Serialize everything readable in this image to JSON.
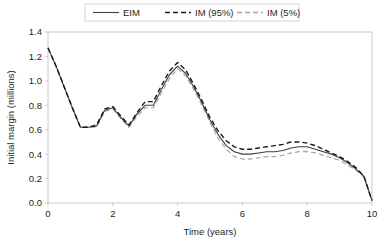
{
  "chart_data": {
    "type": "line",
    "title": "",
    "xlabel": "Time (years)",
    "ylabel": "Initial margin (millions)",
    "xlim": [
      0,
      10
    ],
    "ylim": [
      0,
      1.4
    ],
    "xticks": [
      0,
      2,
      4,
      6,
      8,
      10
    ],
    "xtick_labels": [
      "0",
      "2",
      "4",
      "6",
      "8",
      "10"
    ],
    "yticks": [
      0.0,
      0.2,
      0.4,
      0.6,
      0.8,
      1.0,
      1.2,
      1.4
    ],
    "ytick_labels": [
      "0.0",
      "0.2",
      "0.4",
      "0.6",
      "0.8",
      "1.0",
      "1.2",
      "1.4"
    ],
    "grid": false,
    "legend_position": "top-center",
    "x": [
      0,
      0.25,
      0.5,
      0.75,
      1.0,
      1.25,
      1.5,
      1.75,
      2.0,
      2.25,
      2.5,
      2.75,
      3.0,
      3.25,
      3.5,
      3.75,
      4.0,
      4.25,
      4.5,
      4.75,
      5.0,
      5.25,
      5.5,
      5.75,
      6.0,
      6.25,
      6.5,
      6.75,
      7.0,
      7.25,
      7.5,
      7.75,
      8.0,
      8.25,
      8.5,
      8.75,
      9.0,
      9.25,
      9.5,
      9.75,
      10.0
    ],
    "series": [
      {
        "name": "EIM",
        "style": "solid",
        "color": "#3f3f3f",
        "width": 1.1,
        "values": [
          1.27,
          1.12,
          0.95,
          0.78,
          0.62,
          0.62,
          0.63,
          0.76,
          0.78,
          0.7,
          0.63,
          0.73,
          0.8,
          0.8,
          0.93,
          1.05,
          1.12,
          1.06,
          0.95,
          0.82,
          0.68,
          0.56,
          0.47,
          0.42,
          0.4,
          0.4,
          0.41,
          0.42,
          0.42,
          0.43,
          0.45,
          0.46,
          0.46,
          0.44,
          0.42,
          0.4,
          0.37,
          0.33,
          0.28,
          0.22,
          0.02
        ]
      },
      {
        "name": "IM (95%)",
        "style": "dashed",
        "color": "#1a1a1a",
        "width": 1.4,
        "values": [
          1.27,
          1.12,
          0.95,
          0.78,
          0.62,
          0.62,
          0.64,
          0.77,
          0.79,
          0.71,
          0.64,
          0.74,
          0.83,
          0.83,
          0.96,
          1.08,
          1.15,
          1.09,
          0.97,
          0.84,
          0.7,
          0.59,
          0.51,
          0.46,
          0.44,
          0.44,
          0.45,
          0.46,
          0.47,
          0.48,
          0.5,
          0.5,
          0.49,
          0.47,
          0.44,
          0.41,
          0.38,
          0.34,
          0.29,
          0.22,
          0.02
        ]
      },
      {
        "name": "IM (5%)",
        "style": "dashed",
        "color": "#a6a6a6",
        "width": 1.2,
        "values": [
          1.27,
          1.12,
          0.95,
          0.78,
          0.62,
          0.62,
          0.62,
          0.75,
          0.77,
          0.69,
          0.62,
          0.71,
          0.78,
          0.78,
          0.9,
          1.02,
          1.1,
          1.04,
          0.93,
          0.8,
          0.66,
          0.53,
          0.44,
          0.38,
          0.36,
          0.36,
          0.37,
          0.38,
          0.38,
          0.39,
          0.41,
          0.42,
          0.42,
          0.41,
          0.39,
          0.37,
          0.35,
          0.31,
          0.27,
          0.21,
          0.02
        ]
      }
    ],
    "legend": [
      {
        "label": "EIM",
        "style": "solid",
        "color": "#3f3f3f"
      },
      {
        "label": "IM (95%)",
        "style": "dashed",
        "color": "#1a1a1a"
      },
      {
        "label": "IM (5%)",
        "style": "dashed",
        "color": "#a6a6a6"
      }
    ]
  }
}
